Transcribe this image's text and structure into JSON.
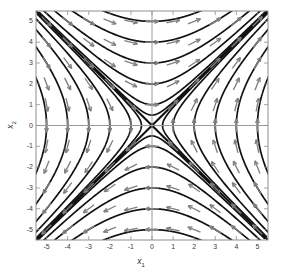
{
  "figure": {
    "kind": "phase-portrait",
    "background": "#ffffff",
    "frame_color": "#9a9a9a",
    "trajectory_color": "#111111",
    "arrow_color": "#808080",
    "axis_line_color": "#9a9a9a"
  },
  "axes": {
    "x": {
      "label": "x",
      "sub": "1",
      "min": -5.5,
      "max": 5.5,
      "ticks": [
        -5,
        -4,
        -3,
        -2,
        -1,
        0,
        1,
        2,
        3,
        4,
        5
      ],
      "tick_labels": [
        "-5",
        "-4",
        "-3",
        "-2",
        "-1",
        "0",
        "1",
        "2",
        "3",
        "4",
        "5"
      ]
    },
    "y": {
      "label": "x",
      "sub": "2",
      "min": -5.5,
      "max": 5.5,
      "ticks": [
        -5,
        -4,
        -3,
        -2,
        -1,
        0,
        1,
        2,
        3,
        4,
        5
      ],
      "tick_labels": [
        "-5",
        "-4",
        "-3",
        "-2",
        "-1",
        "0",
        "1",
        "2",
        "3",
        "4",
        "5"
      ]
    }
  },
  "chart_data": {
    "type": "line",
    "title": "",
    "xlabel": "x1",
    "ylabel": "x2",
    "xlim": [
      -5.5,
      5.5
    ],
    "ylim": [
      -5.5,
      5.5
    ],
    "grid": false,
    "legend": "none",
    "system": {
      "description": "Linear planar system with a saddle point at the origin",
      "fixed_points": [
        {
          "x": 0,
          "y": 0,
          "type": "saddle"
        }
      ],
      "invariant_lines": [
        {
          "name": "unstable-manifold",
          "slope": 1,
          "intercept": 0,
          "direction": "outward"
        },
        {
          "name": "stable-manifold",
          "slope": -1,
          "intercept": 0,
          "direction": "inward"
        }
      ],
      "flow_rule": "u = (x1+x2)/2 grows, v = (x1-x2)/2 decays; trajectories are hyperbolas u*v = const asymptotic to y=x and y=-x"
    },
    "trajectory_constants": [
      -9.0,
      -6.25,
      -4.0,
      -2.25,
      -1.0,
      -0.25,
      -0.0625,
      0,
      0.0625,
      0.25,
      1.0,
      2.25,
      4.0,
      6.25,
      9.0
    ],
    "arrow_grid": {
      "x": [
        -5,
        -4,
        -3,
        -2,
        -1,
        0,
        1,
        2,
        3,
        4,
        5
      ],
      "y": [
        -5,
        -4,
        -3,
        -2,
        -1,
        0,
        1,
        2,
        3,
        4,
        5
      ],
      "vector_field": "dx1/dt = x2, dx2/dt = x1 (saddle)",
      "color": "#808080"
    }
  }
}
